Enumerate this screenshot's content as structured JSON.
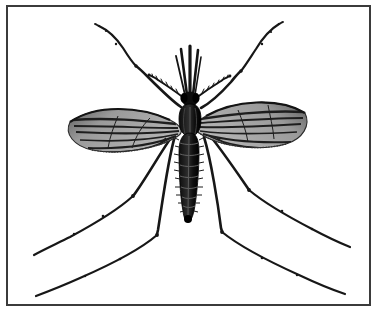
{
  "figure": {
    "kind": "scientific-illustration",
    "view": "dorsal",
    "caption": "",
    "background_color": "#ffffff",
    "ink_color": "#1a1a1a",
    "wing_membrane_color": "#8e8e8e",
    "wing_vein_color": "#262626",
    "border": {
      "present": true,
      "color": "#3b3b3b",
      "thickness_px": 2,
      "inset": {
        "left": 7,
        "top": 6,
        "right": 11,
        "bottom": 13
      }
    },
    "canvas": {
      "width": 381,
      "height": 318
    }
  },
  "anatomy": {
    "head": {
      "label": "head",
      "center": {
        "x": 190,
        "y": 93
      },
      "proboscis_label": "proboscis",
      "palps_label": "maxillary-palps",
      "antennae_label": "antennae",
      "proboscis_length_px": 48
    },
    "thorax": {
      "label": "thorax",
      "center": {
        "x": 190,
        "y": 118
      },
      "width_px": 16,
      "height_px": 34
    },
    "abdomen": {
      "label": "abdomen",
      "center": {
        "x": 189,
        "y": 175
      },
      "segments": 8,
      "width_px": 15,
      "length_px": 92,
      "tip": {
        "x": 188,
        "y": 221
      }
    },
    "wings": [
      {
        "label": "left-wing",
        "tip": {
          "x": 70,
          "y": 122
        },
        "base": {
          "x": 178,
          "y": 132
        },
        "vein_count": 7,
        "fringe": true
      },
      {
        "label": "right-wing",
        "tip": {
          "x": 305,
          "y": 113
        },
        "base": {
          "x": 200,
          "y": 130
        },
        "vein_count": 7,
        "fringe": true
      }
    ],
    "legs": [
      {
        "label": "left-foreleg",
        "direction": "up-left",
        "tip": {
          "x": 95,
          "y": 25
        },
        "joints": 3
      },
      {
        "label": "right-foreleg",
        "direction": "up-right",
        "tip": {
          "x": 278,
          "y": 22
        },
        "joints": 3
      },
      {
        "label": "left-midleg",
        "direction": "down-left",
        "tip": {
          "x": 33,
          "y": 256
        },
        "joints": 3
      },
      {
        "label": "right-midleg",
        "direction": "down-right",
        "tip": {
          "x": 350,
          "y": 247
        },
        "joints": 3
      },
      {
        "label": "left-hindleg",
        "direction": "down-left",
        "tip": {
          "x": 35,
          "y": 297
        },
        "joints": 3
      },
      {
        "label": "right-hindleg",
        "direction": "down-right",
        "tip": {
          "x": 345,
          "y": 294
        },
        "joints": 3
      }
    ]
  }
}
